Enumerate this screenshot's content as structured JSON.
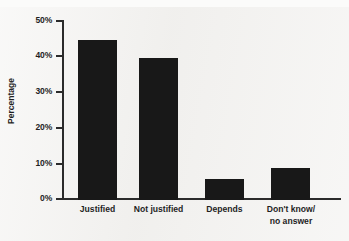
{
  "chart_data": {
    "type": "bar",
    "title": "",
    "subtitle": "",
    "xlabel": "",
    "ylabel": "Percentage",
    "categories": [
      "Justified",
      "Not justified",
      "Depends",
      "Don't know/\nno answer"
    ],
    "values": [
      45,
      40,
      6,
      9
    ],
    "ylim": [
      0,
      50
    ],
    "y_ticks": [
      0,
      10,
      20,
      30,
      40,
      50
    ],
    "y_tick_labels": [
      "0%",
      "10%",
      "20%",
      "30%",
      "40%",
      "50%"
    ],
    "grid": false,
    "legend": null,
    "series": [
      {
        "name": "Percentage",
        "values": [
          45,
          40,
          6,
          9
        ]
      }
    ],
    "colors": {
      "bar": "#181818",
      "axis": "#2b2b2b",
      "background": "#f2f1ef",
      "text": "#1f1f1f"
    }
  }
}
